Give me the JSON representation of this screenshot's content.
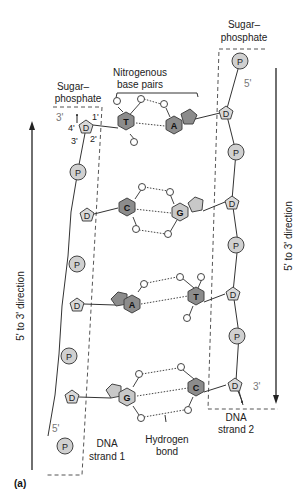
{
  "labels": {
    "sugar_phosphate_left_1": "Sugar–",
    "sugar_phosphate_left_2": "phosphate",
    "sugar_phosphate_right_1": "Sugar–",
    "sugar_phosphate_right_2": "phosphate",
    "nitrogenous_1": "Nitrogenous",
    "nitrogenous_2": "base pairs",
    "hydrogen_1": "Hydrogen",
    "hydrogen_2": "bond",
    "strand1_1": "DNA",
    "strand1_2": "strand 1",
    "strand2_1": "DNA",
    "strand2_2": "strand 2",
    "left_direction": "5' to 3' direction",
    "right_direction": "5' to 3' direction",
    "panel": "(a)"
  },
  "primes": {
    "left_top": "3'",
    "left_bottom": "5'",
    "right_top": "5'",
    "right_bottom": "3'",
    "c4": "4'",
    "c3": "3'",
    "c2": "2'",
    "c1": "1'"
  },
  "symbols": {
    "phosphate": "P",
    "deoxyribose": "D"
  },
  "base_pairs": [
    {
      "left": "T",
      "right": "A"
    },
    {
      "left": "C",
      "right": "G"
    },
    {
      "left": "A",
      "right": "T"
    },
    {
      "left": "G",
      "right": "C"
    }
  ],
  "colors": {
    "purine_dark": "#8c8c8c",
    "pyrimidine_dark": "#8c8c8c",
    "light_base": "#c8c8c8",
    "sugar": "#d9d9d9",
    "phosphate": "#d0d0d0",
    "stroke": "#333333",
    "dashes": "#555555"
  }
}
